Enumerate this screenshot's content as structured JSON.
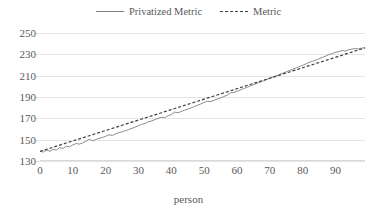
{
  "chart_data": {
    "type": "line",
    "title": "",
    "xlabel": "person",
    "ylabel": "",
    "xlim": [
      0,
      99
    ],
    "ylim": [
      130,
      250
    ],
    "grid": true,
    "legend_position": "top-center",
    "y_ticks": [
      250,
      230,
      210,
      190,
      170,
      150,
      130
    ],
    "x_ticks": [
      0,
      10,
      20,
      30,
      40,
      50,
      60,
      70,
      80,
      90
    ],
    "colors": {
      "privatized_metric": "#808080",
      "metric": "#404040",
      "gridline": "#e4e4e4",
      "text": "#595959"
    },
    "series": [
      {
        "name": "Privatized Metric",
        "style": "solid",
        "color": "#808080",
        "x": [
          0,
          1,
          2,
          3,
          4,
          5,
          6,
          7,
          8,
          9,
          10,
          11,
          12,
          13,
          14,
          15,
          16,
          17,
          18,
          19,
          20,
          21,
          22,
          23,
          24,
          25,
          26,
          27,
          28,
          29,
          30,
          31,
          32,
          33,
          34,
          35,
          36,
          37,
          38,
          39,
          40,
          41,
          42,
          43,
          44,
          45,
          46,
          47,
          48,
          49,
          50,
          51,
          52,
          53,
          54,
          55,
          56,
          57,
          58,
          59,
          60,
          61,
          62,
          63,
          64,
          65,
          66,
          67,
          68,
          69,
          70,
          71,
          72,
          73,
          74,
          75,
          76,
          77,
          78,
          79,
          80,
          81,
          82,
          83,
          84,
          85,
          86,
          87,
          88,
          89,
          90,
          91,
          92,
          93,
          94,
          95,
          96,
          97,
          98,
          99
        ],
        "values": [
          139.2,
          138.4,
          140.3,
          139.1,
          141.0,
          140.2,
          142.6,
          141.8,
          143.9,
          143.2,
          145.1,
          146.4,
          145.8,
          147.0,
          148.4,
          150.5,
          149.0,
          150.1,
          151.3,
          152.0,
          153.2,
          154.6,
          153.9,
          155.4,
          156.6,
          157.3,
          158.5,
          159.4,
          160.6,
          161.8,
          163.1,
          164.4,
          165.2,
          166.7,
          167.6,
          168.8,
          170.0,
          171.1,
          170.6,
          172.4,
          173.6,
          175.9,
          175.2,
          176.4,
          177.6,
          178.5,
          179.8,
          181.0,
          182.3,
          183.5,
          184.9,
          186.1,
          185.6,
          186.9,
          188.0,
          189.2,
          190.4,
          191.7,
          193.9,
          194.2,
          195.4,
          196.6,
          197.9,
          199.0,
          200.3,
          201.5,
          202.7,
          203.9,
          205.1,
          206.3,
          207.6,
          208.8,
          209.9,
          211.2,
          212.4,
          213.6,
          214.9,
          216.0,
          217.3,
          218.5,
          219.7,
          221.0,
          222.6,
          223.4,
          224.6,
          225.8,
          227.1,
          228.3,
          229.8,
          230.7,
          231.9,
          232.4,
          233.6,
          233.1,
          234.3,
          234.9,
          235.4,
          235.1,
          235.8,
          236.2
        ]
      },
      {
        "name": "Metric",
        "style": "dashed",
        "color": "#404040",
        "x": [
          0,
          1,
          2,
          3,
          4,
          5,
          6,
          7,
          8,
          9,
          10,
          11,
          12,
          13,
          14,
          15,
          16,
          17,
          18,
          19,
          20,
          21,
          22,
          23,
          24,
          25,
          26,
          27,
          28,
          29,
          30,
          31,
          32,
          33,
          34,
          35,
          36,
          37,
          38,
          39,
          40,
          41,
          42,
          43,
          44,
          45,
          46,
          47,
          48,
          49,
          50,
          51,
          52,
          53,
          54,
          55,
          56,
          57,
          58,
          59,
          60,
          61,
          62,
          63,
          64,
          65,
          66,
          67,
          68,
          69,
          70,
          71,
          72,
          73,
          74,
          75,
          76,
          77,
          78,
          79,
          80,
          81,
          82,
          83,
          84,
          85,
          86,
          87,
          88,
          89,
          90,
          91,
          92,
          93,
          94,
          95,
          96,
          97,
          98,
          99
        ],
        "values": [
          139.0,
          139.98,
          140.96,
          141.94,
          142.92,
          143.9,
          144.88,
          145.86,
          146.84,
          147.82,
          148.8,
          149.78,
          150.76,
          151.74,
          152.72,
          153.7,
          154.68,
          155.66,
          156.64,
          157.62,
          158.6,
          159.58,
          160.56,
          161.54,
          162.52,
          163.5,
          164.48,
          165.46,
          166.44,
          167.42,
          168.4,
          169.38,
          170.36,
          171.34,
          172.32,
          173.3,
          174.28,
          175.26,
          176.24,
          177.22,
          178.2,
          179.18,
          180.16,
          181.14,
          182.12,
          183.1,
          184.08,
          185.06,
          186.04,
          187.02,
          188.0,
          188.98,
          189.96,
          190.94,
          191.92,
          192.9,
          193.88,
          194.86,
          195.84,
          196.82,
          197.8,
          198.78,
          199.76,
          200.74,
          201.72,
          202.7,
          203.68,
          204.66,
          205.64,
          206.62,
          207.6,
          208.58,
          209.56,
          210.54,
          211.52,
          212.5,
          213.48,
          214.46,
          215.44,
          216.42,
          217.4,
          218.38,
          219.36,
          220.34,
          221.32,
          222.3,
          223.28,
          224.26,
          225.24,
          226.22,
          227.2,
          228.18,
          229.16,
          230.14,
          231.12,
          232.1,
          233.08,
          234.06,
          235.04,
          236.0
        ]
      }
    ]
  },
  "legend": {
    "items": [
      {
        "label": "Privatized Metric",
        "style": "solid"
      },
      {
        "label": "Metric",
        "style": "dashed"
      }
    ]
  },
  "axis": {
    "x_title": "person"
  }
}
